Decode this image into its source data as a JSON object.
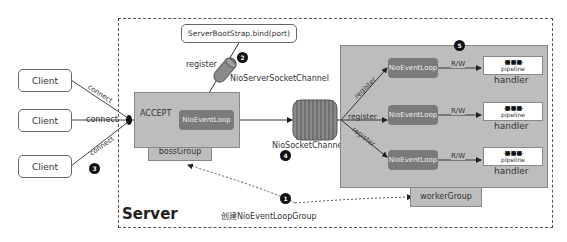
{
  "clients": [
    {
      "label": "Client"
    },
    {
      "label": "Client"
    },
    {
      "label": "Client"
    }
  ],
  "connect_labels": [
    "connect",
    "connect",
    "connect"
  ],
  "server": {
    "label": "Server"
  },
  "bind": {
    "label": "ServerBootStrap.bind(port)"
  },
  "register_label": "register",
  "server_channel_label": "NioServerSocketChannel",
  "socket_channel_label": "NioSocketChannel",
  "boss": {
    "accept_label": "ACCEPT",
    "event_loop_label": "NioEventLoop",
    "group_label": "bossGroup"
  },
  "worker": {
    "group_label": "workerGroup",
    "rows": [
      {
        "register": "register",
        "event_loop": "NioEventLoop",
        "rw": "R/W",
        "pipeline_dots": "-■-■-■-",
        "pipeline": "pipeline",
        "handler": "handler"
      },
      {
        "register": "register",
        "event_loop": "NioEventLoop",
        "rw": "R/W",
        "pipeline_dots": "-■-■-■-",
        "pipeline": "pipeline",
        "handler": "handler"
      },
      {
        "register": "register",
        "event_loop": "NioEventLoop",
        "rw": "R/W",
        "pipeline_dots": "-■-■-■-",
        "pipeline": "pipeline",
        "handler": "handler"
      }
    ]
  },
  "create_group_label": "创建NioEventLoopGroup",
  "badges": [
    "1",
    "2",
    "3",
    "4",
    "5"
  ],
  "colors": {
    "group_fill": "#bdbdbd",
    "event_loop_fill": "#7a7a7a",
    "badge_fill": "#111111",
    "channel_fill": "#8a8a8a"
  }
}
